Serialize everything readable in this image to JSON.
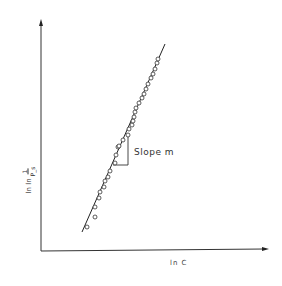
{
  "chart_data": {
    "type": "scatter",
    "title": "",
    "xlabel": "ln C",
    "ylabel": "ln ln 1/P_s",
    "grid": false,
    "legend": null,
    "annotation": "Slope  m",
    "fit_line": {
      "x1": 82,
      "y1": 232,
      "x2": 165,
      "y2": 44
    },
    "points_px": [
      [
        87,
        227
      ],
      [
        95,
        217
      ],
      [
        95,
        207
      ],
      [
        99,
        198
      ],
      [
        100,
        192
      ],
      [
        104,
        187
      ],
      [
        105,
        181
      ],
      [
        108,
        177
      ],
      [
        110,
        171
      ],
      [
        115,
        163
      ],
      [
        116,
        155
      ],
      [
        118,
        147
      ],
      [
        119,
        146
      ],
      [
        123,
        140
      ],
      [
        128,
        135
      ],
      [
        129,
        129
      ],
      [
        132,
        125
      ],
      [
        133,
        121
      ],
      [
        134,
        117
      ],
      [
        135,
        112
      ],
      [
        136,
        108
      ],
      [
        139,
        103
      ],
      [
        142,
        98
      ],
      [
        144,
        94
      ],
      [
        146,
        89
      ],
      [
        148,
        84
      ],
      [
        151,
        78
      ],
      [
        153,
        74
      ],
      [
        155,
        69
      ],
      [
        157,
        63
      ],
      [
        158,
        59
      ]
    ],
    "axis_units": "unlabeled (no ticks)"
  },
  "labels": {
    "y_axis_prefix": "ln ln",
    "y_axis_num": "1",
    "y_axis_den": "P_s",
    "x_axis": "ln  C",
    "slope": "Slope   m"
  }
}
